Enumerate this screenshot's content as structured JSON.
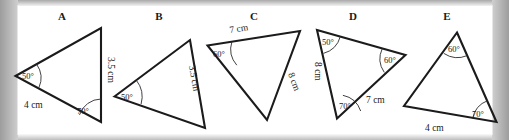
{
  "page": {
    "background_color": "#ffffff",
    "frame_color": "#b0b0b0",
    "ink_color": "#1b1b1b"
  },
  "figures": [
    {
      "letter": "A",
      "angles": [
        "50°",
        "70°"
      ],
      "sides": [
        "4 cm",
        "3.5 cm"
      ],
      "labels": {
        "angle_left": "50°",
        "angle_bottom_right": "70°",
        "side_bottom": "4 cm",
        "side_right": "3.5 cm"
      }
    },
    {
      "letter": "B",
      "angles": [
        "50°"
      ],
      "sides": [
        "3.5 cm"
      ],
      "labels": {
        "angle_left": "50°",
        "side_right": "3.5 cm"
      }
    },
    {
      "letter": "C",
      "angles": [
        "60°"
      ],
      "sides": [
        "7 cm",
        "8 cm"
      ],
      "labels": {
        "angle_top_left": "60°",
        "side_top": "7 cm",
        "side_right": "8 cm"
      }
    },
    {
      "letter": "D",
      "angles": [
        "50°",
        "60°",
        "70°"
      ],
      "sides": [
        "8 cm",
        "7 cm"
      ],
      "labels": {
        "angle_top_left": "50°",
        "angle_right": "60°",
        "angle_bottom": "70°",
        "side_left": "8 cm",
        "side_bottom_right": "7 cm"
      }
    },
    {
      "letter": "E",
      "angles": [
        "60°",
        "70°"
      ],
      "sides": [
        "4 cm"
      ],
      "labels": {
        "angle_top": "60°",
        "angle_bottom_right": "70°",
        "side_bottom": "4 cm"
      }
    }
  ]
}
